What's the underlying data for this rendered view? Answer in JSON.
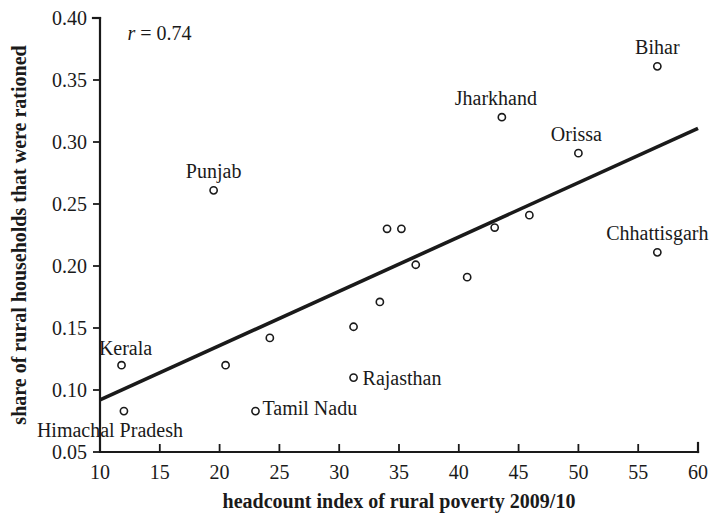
{
  "chart_data": {
    "type": "scatter",
    "title": "",
    "subtitle": "",
    "xlabel": "headcount index of rural poverty 2009/10",
    "ylabel": "share of rural households that were rationed",
    "xlim": [
      10,
      60
    ],
    "ylim": [
      0.05,
      0.4
    ],
    "xticks": [
      10,
      15,
      20,
      25,
      30,
      35,
      40,
      45,
      50,
      55,
      60
    ],
    "xtick_labels": [
      "10",
      "15",
      "20",
      "25",
      "30",
      "35",
      "40",
      "45",
      "50",
      "55",
      "60"
    ],
    "yticks": [
      0.05,
      0.1,
      0.15,
      0.2,
      0.25,
      0.3,
      0.35,
      0.4
    ],
    "ytick_labels": [
      "0.05",
      "0.10",
      "0.15",
      "0.20",
      "0.25",
      "0.30",
      "0.35",
      "0.40"
    ],
    "grid": false,
    "legend": "none",
    "annotations": [
      {
        "name": "correlation",
        "symbol": "r",
        "equals": " = ",
        "value": "0.74",
        "text": "r = 0.74",
        "x": 12.3,
        "y": 0.382
      }
    ],
    "trendline": {
      "name": "fitted regression line",
      "x": [
        10,
        60
      ],
      "y": [
        0.092,
        0.311
      ]
    },
    "points": [
      {
        "label": "Kerala",
        "x": 11.8,
        "y": 0.12,
        "label_dx": 4,
        "label_dy": -10
      },
      {
        "label": "Himachal Pradesh",
        "x": 12.0,
        "y": 0.083,
        "label_dx": -14,
        "label_dy": 26
      },
      {
        "label": "",
        "x": 20.5,
        "y": 0.12,
        "label_dx": 0,
        "label_dy": 0
      },
      {
        "label": "Tamil Nadu",
        "x": 23.0,
        "y": 0.083,
        "label_dx": 7,
        "label_dy": 4
      },
      {
        "label": "",
        "x": 24.2,
        "y": 0.142,
        "label_dx": 0,
        "label_dy": 0
      },
      {
        "label": "",
        "x": 31.2,
        "y": 0.151,
        "label_dx": 0,
        "label_dy": 0
      },
      {
        "label": "Rajasthan",
        "x": 31.2,
        "y": 0.11,
        "label_dx": 9,
        "label_dy": 7
      },
      {
        "label": "",
        "x": 33.4,
        "y": 0.171,
        "label_dx": 0,
        "label_dy": 0
      },
      {
        "label": "",
        "x": 34.0,
        "y": 0.23,
        "label_dx": 0,
        "label_dy": 0
      },
      {
        "label": "",
        "x": 35.2,
        "y": 0.23,
        "label_dx": 0,
        "label_dy": 0
      },
      {
        "label": "",
        "x": 36.4,
        "y": 0.201,
        "label_dx": 0,
        "label_dy": 0
      },
      {
        "label": "",
        "x": 40.7,
        "y": 0.191,
        "label_dx": 0,
        "label_dy": 0
      },
      {
        "label": "",
        "x": 43.0,
        "y": 0.231,
        "label_dx": 0,
        "label_dy": 0
      },
      {
        "label": "Jharkhand",
        "x": 43.6,
        "y": 0.32,
        "label_dx": -6,
        "label_dy": -12
      },
      {
        "label": "",
        "x": 45.9,
        "y": 0.241,
        "label_dx": 0,
        "label_dy": 0
      },
      {
        "label": "Orissa",
        "x": 50.0,
        "y": 0.291,
        "label_dx": -2,
        "label_dy": -12
      },
      {
        "label": "Bihar",
        "x": 56.6,
        "y": 0.361,
        "label_dx": 0,
        "label_dy": -12
      },
      {
        "label": "Chhattisgarh",
        "x": 56.6,
        "y": 0.211,
        "label_dx": 0,
        "label_dy": -12
      }
    ],
    "labeled_states": [
      "Kerala",
      "Himachal Pradesh",
      "Tamil Nadu",
      "Rajasthan",
      "Punjab",
      "Jharkhand",
      "Orissa",
      "Bihar",
      "Chhattisgarh"
    ]
  },
  "colors": {
    "ink": "#1a1a1a",
    "background": "#ffffff",
    "marker_fill": "#ffffff"
  }
}
